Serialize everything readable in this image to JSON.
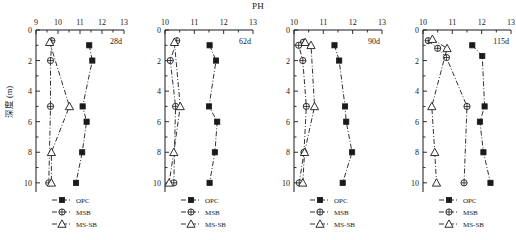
{
  "chart_data": {
    "type": "line",
    "title": "PH",
    "xlabel": "PH",
    "ylabel": "深度 (m)",
    "ylim": [
      0,
      10.6
    ],
    "ytick_labels": [
      "0",
      "2",
      "4",
      "6",
      "8",
      "10"
    ],
    "yticks": [
      0,
      2,
      4,
      6,
      8,
      10
    ],
    "grid": false,
    "orientation": "depth-inverted",
    "legend_position": "bottom-left-inside",
    "legend": [
      {
        "name": "OPC",
        "marker": "filled-square"
      },
      {
        "name": "MSB",
        "marker": "crossed-circle"
      },
      {
        "name": "MS-SB",
        "marker": "open-triangle"
      }
    ],
    "panels": [
      {
        "tag": "28d",
        "xlim": [
          9,
          13
        ],
        "xtick_labels": [
          "9",
          "10",
          "11",
          "12",
          "13"
        ],
        "xticks": [
          9,
          10,
          11,
          12,
          13
        ],
        "series": [
          {
            "name": "OPC",
            "marker": "filled-square",
            "y": [
              1,
              2,
              5,
              6,
              8,
              10
            ],
            "values": [
              11.42,
              11.56,
              11.12,
              11.3,
              11.1,
              10.82
            ]
          },
          {
            "name": "MSB",
            "marker": "crossed-circle",
            "y": [
              0.7,
              2,
              5,
              10
            ],
            "values": [
              9.72,
              9.66,
              9.66,
              9.58
            ]
          },
          {
            "name": "MS-SB",
            "marker": "open-triangle",
            "y": [
              0.8,
              5,
              8,
              10
            ],
            "values": [
              9.62,
              10.52,
              9.7,
              9.7
            ]
          }
        ]
      },
      {
        "tag": "62d",
        "xlim": [
          10,
          13
        ],
        "xtick_labels": [
          "10",
          "11",
          "12",
          "13"
        ],
        "xticks": [
          10,
          11,
          12,
          13
        ],
        "series": [
          {
            "name": "OPC",
            "marker": "filled-square",
            "y": [
              1,
              2,
              5,
              6,
              8,
              10
            ],
            "values": [
              11.52,
              11.74,
              11.5,
              11.78,
              11.7,
              11.52
            ]
          },
          {
            "name": "MSB",
            "marker": "crossed-circle",
            "y": [
              0.7,
              2,
              5,
              10
            ],
            "values": [
              10.4,
              10.18,
              10.36,
              10.3
            ]
          },
          {
            "name": "MS-SB",
            "marker": "open-triangle",
            "y": [
              0.8,
              5,
              8,
              10
            ],
            "values": [
              10.32,
              10.52,
              10.3,
              10.14
            ]
          }
        ]
      },
      {
        "tag": "90d",
        "xlim": [
          10,
          13
        ],
        "xtick_labels": [
          "10",
          "11",
          "12",
          "13"
        ],
        "xticks": [
          10,
          11,
          12,
          13
        ],
        "series": [
          {
            "name": "OPC",
            "marker": "filled-square",
            "y": [
              1,
              2,
              5,
              6,
              8,
              10
            ],
            "values": [
              11.38,
              11.54,
              11.74,
              11.78,
              11.98,
              11.66
            ]
          },
          {
            "name": "MSB",
            "marker": "crossed-circle",
            "y": [
              0.8,
              1,
              2,
              5,
              8,
              10
            ],
            "values": [
              10.32,
              10.16,
              10.3,
              10.42,
              10.34,
              10.18
            ]
          },
          {
            "name": "MS-SB",
            "marker": "open-triangle",
            "y": [
              0.8,
              1,
              5,
              8,
              10
            ],
            "values": [
              10.38,
              10.58,
              10.7,
              10.36,
              10.3
            ]
          }
        ]
      },
      {
        "tag": "115d",
        "xlim": [
          10,
          13
        ],
        "xtick_labels": [
          "10",
          "11",
          "12",
          "13"
        ],
        "xticks": [
          10,
          11,
          12,
          13
        ],
        "series": [
          {
            "name": "OPC",
            "marker": "filled-square",
            "y": [
              1,
              1.7,
              5,
              6,
              8,
              10
            ],
            "values": [
              11.68,
              12.02,
              12.1,
              11.94,
              12.06,
              12.3
            ]
          },
          {
            "name": "MSB",
            "marker": "crossed-circle",
            "y": [
              0.7,
              1.2,
              1.8,
              5,
              10
            ],
            "values": [
              10.18,
              10.5,
              10.8,
              11.5,
              11.4
            ]
          },
          {
            "name": "MS-SB",
            "marker": "open-triangle",
            "y": [
              0.6,
              1.2,
              5,
              8,
              10
            ],
            "values": [
              10.32,
              10.82,
              10.3,
              10.4,
              10.46
            ]
          }
        ]
      }
    ]
  }
}
